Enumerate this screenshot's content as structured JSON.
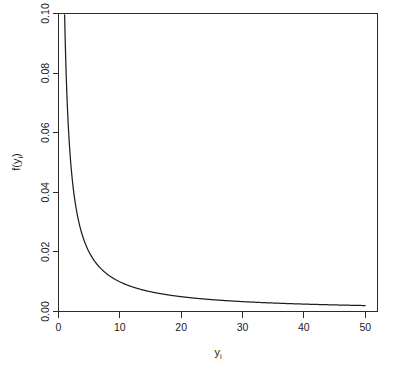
{
  "chart_data": {
    "type": "line",
    "title": "",
    "subtitle": "",
    "xlabel": "y_i",
    "xlabel_base": "y",
    "xlabel_sub": "i",
    "ylabel": "f(y_i)",
    "ylabel_base_open": "f(y",
    "ylabel_sub": "i",
    "ylabel_base_close": ")",
    "xlim": [
      0,
      52
    ],
    "ylim": [
      0.0,
      0.1
    ],
    "xticks": [
      0,
      10,
      20,
      30,
      40,
      50
    ],
    "xtick_labels": [
      "0",
      "10",
      "20",
      "30",
      "40",
      "50"
    ],
    "yticks": [
      0.0,
      0.02,
      0.04,
      0.06,
      0.08,
      0.1
    ],
    "ytick_labels": [
      "0.00",
      "0.02",
      "0.04",
      "0.06",
      "0.08",
      "0.10"
    ],
    "grid": false,
    "legend": false,
    "legend_position": "none",
    "line_color": "#1f1f1f",
    "axis_color": "#2b2b2b",
    "background_color": "#ffffff",
    "function_note": "f(y_i) = 0.1 / y_i",
    "x": [
      1,
      1.5,
      2,
      2.5,
      3,
      3.5,
      4,
      4.5,
      5,
      6,
      7,
      8,
      9,
      10,
      12,
      14,
      16,
      18,
      20,
      22,
      25,
      28,
      30,
      33,
      36,
      40,
      44,
      47,
      50
    ],
    "y": [
      0.0995,
      0.0667,
      0.05,
      0.04,
      0.0333,
      0.0286,
      0.025,
      0.0222,
      0.02,
      0.0167,
      0.0143,
      0.0125,
      0.0111,
      0.01,
      0.0083,
      0.0071,
      0.0063,
      0.0056,
      0.005,
      0.0045,
      0.004,
      0.0036,
      0.0033,
      0.003,
      0.0028,
      0.0025,
      0.0023,
      0.0021,
      0.002
    ],
    "series": [
      {
        "name": "f(y_i)",
        "values": [
          0.0995,
          0.0667,
          0.05,
          0.04,
          0.0333,
          0.0286,
          0.025,
          0.0222,
          0.02,
          0.0167,
          0.0143,
          0.0125,
          0.0111,
          0.01,
          0.0083,
          0.0071,
          0.0063,
          0.0056,
          0.005,
          0.0045,
          0.004,
          0.0036,
          0.0033,
          0.003,
          0.0028,
          0.0025,
          0.0023,
          0.0021,
          0.002
        ]
      }
    ]
  }
}
